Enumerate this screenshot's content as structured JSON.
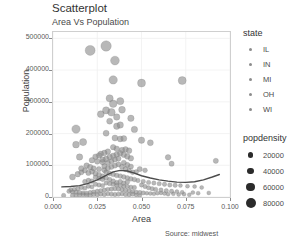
{
  "chart_data": {
    "type": "scatter",
    "title": "Scatterplot",
    "subtitle": "Area Vs Population",
    "caption": "Source: midwest",
    "xlabel": "Area",
    "ylabel": "Population",
    "xlim": [
      0.0,
      0.1
    ],
    "ylim": [
      0,
      520000
    ],
    "grid": true,
    "xticks": [
      "0.000",
      "0.025",
      "0.050",
      "0.075",
      "0.100"
    ],
    "xtick_values": [
      0.0,
      0.025,
      0.05,
      0.075,
      0.1
    ],
    "yticks": [
      "0",
      "100000",
      "200000",
      "300000",
      "400000",
      "500000"
    ],
    "ytick_values": [
      0,
      100000,
      200000,
      300000,
      400000,
      500000
    ],
    "legend_position": "right",
    "color_legend": {
      "title": "state",
      "entries": [
        "IL",
        "IN",
        "MI",
        "OH",
        "WI"
      ]
    },
    "size_legend": {
      "title": "popdensity",
      "entries": [
        "20000",
        "40000",
        "60000",
        "80000"
      ],
      "values": [
        20000,
        40000,
        60000,
        80000
      ],
      "radii_px": [
        2.6,
        3.4,
        4.2,
        5.0
      ]
    },
    "point_color": "#8c8c8c",
    "smooth_line_color": "#4d4d4d",
    "smooth_line": [
      [
        0.005,
        32000
      ],
      [
        0.01,
        33000
      ],
      [
        0.015,
        36000
      ],
      [
        0.02,
        43000
      ],
      [
        0.025,
        54000
      ],
      [
        0.03,
        68000
      ],
      [
        0.034,
        79000
      ],
      [
        0.038,
        84000
      ],
      [
        0.042,
        82000
      ],
      [
        0.046,
        75000
      ],
      [
        0.05,
        67000
      ],
      [
        0.055,
        60000
      ],
      [
        0.06,
        54000
      ],
      [
        0.065,
        50000
      ],
      [
        0.07,
        47000
      ],
      [
        0.075,
        46000
      ],
      [
        0.08,
        48000
      ],
      [
        0.085,
        54000
      ],
      [
        0.09,
        63000
      ],
      [
        0.094,
        71000
      ]
    ],
    "points": [
      [
        0.021,
        462000,
        5.0
      ],
      [
        0.03,
        476000,
        5.2
      ],
      [
        0.035,
        430000,
        4.4
      ],
      [
        0.034,
        369000,
        4.2
      ],
      [
        0.05,
        359000,
        4.0
      ],
      [
        0.073,
        367000,
        4.0
      ],
      [
        0.032,
        311000,
        3.6
      ],
      [
        0.034,
        294000,
        3.8
      ],
      [
        0.038,
        302000,
        3.6
      ],
      [
        0.03,
        273000,
        3.6
      ],
      [
        0.033,
        267000,
        3.8
      ],
      [
        0.027,
        261000,
        3.4
      ],
      [
        0.039,
        275000,
        3.4
      ],
      [
        0.036,
        252000,
        3.2
      ],
      [
        0.044,
        248000,
        3.2
      ],
      [
        0.032,
        239000,
        3.0
      ],
      [
        0.036,
        223000,
        3.2
      ],
      [
        0.038,
        227000,
        3.2
      ],
      [
        0.013,
        214000,
        4.2
      ],
      [
        0.046,
        213000,
        3.2
      ],
      [
        0.03,
        201000,
        3.0
      ],
      [
        0.035,
        186000,
        3.0
      ],
      [
        0.038,
        183000,
        3.0
      ],
      [
        0.04,
        184000,
        3.0
      ],
      [
        0.05,
        179000,
        3.2
      ],
      [
        0.055,
        171000,
        3.0
      ],
      [
        0.017,
        173000,
        3.6
      ],
      [
        0.013,
        165000,
        3.4
      ],
      [
        0.034,
        157000,
        2.8
      ],
      [
        0.036,
        152000,
        2.8
      ],
      [
        0.039,
        148000,
        2.8
      ],
      [
        0.041,
        150000,
        2.8
      ],
      [
        0.043,
        146000,
        2.8
      ],
      [
        0.031,
        143000,
        2.8
      ],
      [
        0.029,
        139000,
        2.8
      ],
      [
        0.027,
        136000,
        2.8
      ],
      [
        0.026,
        131000,
        2.8
      ],
      [
        0.024,
        127000,
        2.8
      ],
      [
        0.015,
        126000,
        3.2
      ],
      [
        0.065,
        125000,
        2.8
      ],
      [
        0.092,
        114000,
        2.6
      ],
      [
        0.067,
        105000,
        2.6
      ],
      [
        0.022,
        116000,
        2.8
      ],
      [
        0.025,
        112000,
        2.8
      ],
      [
        0.028,
        110000,
        2.8
      ],
      [
        0.031,
        108000,
        2.6
      ],
      [
        0.033,
        113000,
        2.6
      ],
      [
        0.035,
        118000,
        2.6
      ],
      [
        0.037,
        121000,
        2.6
      ],
      [
        0.04,
        108000,
        2.6
      ],
      [
        0.042,
        101000,
        2.6
      ],
      [
        0.044,
        96000,
        2.6
      ],
      [
        0.019,
        99000,
        2.8
      ],
      [
        0.021,
        94000,
        2.8
      ],
      [
        0.023,
        90000,
        2.6
      ],
      [
        0.026,
        88000,
        2.6
      ],
      [
        0.029,
        85000,
        2.6
      ],
      [
        0.011,
        63000,
        3.0
      ],
      [
        0.014,
        72000,
        2.8
      ],
      [
        0.016,
        78000,
        2.6
      ],
      [
        0.049,
        88000,
        2.6
      ],
      [
        0.052,
        84000,
        2.4
      ],
      [
        0.047,
        79000,
        2.4
      ],
      [
        0.03,
        78000,
        2.4
      ],
      [
        0.032,
        74000,
        2.4
      ],
      [
        0.034,
        71000,
        2.4
      ],
      [
        0.036,
        68000,
        2.4
      ],
      [
        0.038,
        66000,
        2.4
      ],
      [
        0.04,
        63000,
        2.4
      ],
      [
        0.042,
        60000,
        2.4
      ],
      [
        0.044,
        57000,
        2.4
      ],
      [
        0.046,
        55000,
        2.4
      ],
      [
        0.024,
        62000,
        2.4
      ],
      [
        0.026,
        58000,
        2.4
      ],
      [
        0.028,
        56000,
        2.4
      ],
      [
        0.02,
        52000,
        2.4
      ],
      [
        0.022,
        50000,
        2.4
      ],
      [
        0.018,
        48000,
        2.4
      ],
      [
        0.048,
        52000,
        2.2
      ],
      [
        0.051,
        49000,
        2.2
      ],
      [
        0.054,
        46000,
        2.2
      ],
      [
        0.057,
        44000,
        2.2
      ],
      [
        0.06,
        42000,
        2.2
      ],
      [
        0.063,
        40000,
        2.2
      ],
      [
        0.066,
        38000,
        2.2
      ],
      [
        0.069,
        37000,
        2.2
      ],
      [
        0.072,
        36000,
        2.0
      ],
      [
        0.076,
        34000,
        2.0
      ],
      [
        0.08,
        33000,
        2.0
      ],
      [
        0.084,
        30000,
        2.0
      ],
      [
        0.088,
        13000,
        2.0
      ],
      [
        0.03,
        44000,
        2.2
      ],
      [
        0.032,
        42000,
        2.2
      ],
      [
        0.034,
        40000,
        2.2
      ],
      [
        0.036,
        38000,
        2.2
      ],
      [
        0.038,
        36000,
        2.2
      ],
      [
        0.04,
        34000,
        2.2
      ],
      [
        0.042,
        33000,
        2.2
      ],
      [
        0.044,
        31000,
        2.2
      ],
      [
        0.046,
        30000,
        2.2
      ],
      [
        0.024,
        40000,
        2.2
      ],
      [
        0.026,
        38000,
        2.2
      ],
      [
        0.028,
        36000,
        2.2
      ],
      [
        0.02,
        34000,
        2.2
      ],
      [
        0.022,
        32000,
        2.2
      ],
      [
        0.016,
        30000,
        2.2
      ],
      [
        0.018,
        28000,
        2.2
      ],
      [
        0.014,
        26000,
        2.2
      ],
      [
        0.012,
        24000,
        2.2
      ],
      [
        0.01,
        22000,
        2.2
      ],
      [
        0.006,
        5000,
        2.2
      ],
      [
        0.009,
        18000,
        2.2
      ],
      [
        0.011,
        16000,
        2.2
      ],
      [
        0.013,
        15000,
        2.2
      ],
      [
        0.015,
        14000,
        2.2
      ],
      [
        0.017,
        13000,
        2.2
      ],
      [
        0.019,
        12000,
        2.2
      ],
      [
        0.021,
        14000,
        2.2
      ],
      [
        0.023,
        16000,
        2.2
      ],
      [
        0.025,
        18000,
        2.2
      ],
      [
        0.027,
        20000,
        2.2
      ],
      [
        0.029,
        22000,
        2.2
      ],
      [
        0.031,
        24000,
        2.2
      ],
      [
        0.033,
        25000,
        2.2
      ],
      [
        0.035,
        26000,
        2.2
      ],
      [
        0.037,
        25000,
        2.2
      ],
      [
        0.039,
        23000,
        2.2
      ],
      [
        0.041,
        21000,
        2.2
      ],
      [
        0.043,
        19000,
        2.2
      ],
      [
        0.045,
        17000,
        2.2
      ],
      [
        0.047,
        15000,
        2.2
      ],
      [
        0.049,
        14000,
        2.2
      ],
      [
        0.051,
        13000,
        2.2
      ],
      [
        0.053,
        12000,
        2.0
      ],
      [
        0.055,
        11000,
        2.0
      ],
      [
        0.057,
        10000,
        2.0
      ],
      [
        0.059,
        12000,
        2.0
      ],
      [
        0.061,
        13000,
        2.0
      ],
      [
        0.063,
        11000,
        2.0
      ],
      [
        0.065,
        9000,
        2.0
      ],
      [
        0.068,
        10000,
        2.0
      ],
      [
        0.071,
        8000,
        2.0
      ],
      [
        0.074,
        9000,
        2.0
      ],
      [
        0.077,
        7000,
        2.0
      ],
      [
        0.031,
        10000,
        2.2
      ],
      [
        0.033,
        9000,
        2.2
      ],
      [
        0.035,
        8000,
        2.2
      ],
      [
        0.037,
        9000,
        2.2
      ],
      [
        0.039,
        10000,
        2.2
      ],
      [
        0.041,
        8000,
        2.2
      ],
      [
        0.043,
        7000,
        2.2
      ],
      [
        0.045,
        9000,
        2.2
      ],
      [
        0.023,
        8000,
        2.2
      ],
      [
        0.025,
        7000,
        2.2
      ],
      [
        0.027,
        9000,
        2.2
      ],
      [
        0.029,
        8000,
        2.2
      ],
      [
        0.015,
        6000,
        2.2
      ],
      [
        0.017,
        7000,
        2.2
      ],
      [
        0.019,
        6000,
        2.2
      ],
      [
        0.021,
        5000,
        2.2
      ],
      [
        0.011,
        5000,
        2.2
      ],
      [
        0.013,
        6000,
        2.2
      ],
      [
        0.047,
        6000,
        2.0
      ],
      [
        0.049,
        5000,
        2.0
      ],
      [
        0.036,
        45000,
        2.4
      ],
      [
        0.034,
        50000,
        2.4
      ],
      [
        0.032,
        55000,
        2.4
      ],
      [
        0.03,
        60000,
        2.4
      ],
      [
        0.038,
        48000,
        2.4
      ],
      [
        0.04,
        44000,
        2.4
      ],
      [
        0.042,
        47000,
        2.4
      ],
      [
        0.028,
        65000,
        2.6
      ],
      [
        0.026,
        70000,
        2.6
      ],
      [
        0.024,
        74000,
        2.6
      ],
      [
        0.033,
        95000,
        2.6
      ],
      [
        0.035,
        99000,
        2.6
      ],
      [
        0.037,
        103000,
        2.6
      ],
      [
        0.039,
        95000,
        2.6
      ],
      [
        0.041,
        88000,
        2.6
      ],
      [
        0.031,
        91000,
        2.6
      ],
      [
        0.029,
        97000,
        2.6
      ],
      [
        0.043,
        83000,
        2.4
      ],
      [
        0.045,
        78000,
        2.4
      ],
      [
        0.022,
        80000,
        2.6
      ],
      [
        0.02,
        76000,
        2.6
      ],
      [
        0.018,
        84000,
        2.6
      ],
      [
        0.016,
        90000,
        2.8
      ],
      [
        0.034,
        130000,
        2.8
      ],
      [
        0.036,
        134000,
        2.8
      ],
      [
        0.038,
        138000,
        2.8
      ],
      [
        0.04,
        133000,
        2.8
      ],
      [
        0.042,
        128000,
        2.8
      ],
      [
        0.044,
        122000,
        2.8
      ],
      [
        0.032,
        126000,
        2.8
      ],
      [
        0.03,
        120000,
        2.8
      ],
      [
        0.028,
        118000,
        2.8
      ],
      [
        0.05,
        38000,
        2.2
      ],
      [
        0.052,
        33000,
        2.2
      ],
      [
        0.054,
        29000,
        2.2
      ],
      [
        0.056,
        26000,
        2.2
      ],
      [
        0.058,
        24000,
        2.2
      ],
      [
        0.061,
        22000,
        2.2
      ],
      [
        0.064,
        20000,
        2.2
      ],
      [
        0.067,
        18000,
        2.2
      ],
      [
        0.07,
        17000,
        2.0
      ],
      [
        0.073,
        15000,
        2.0
      ],
      [
        0.079,
        14000,
        2.0
      ],
      [
        0.082,
        12000,
        2.0
      ]
    ]
  }
}
